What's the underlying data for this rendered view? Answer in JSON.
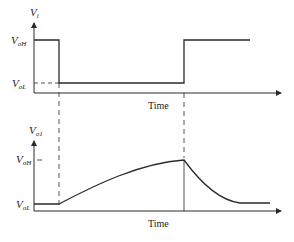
{
  "colors": {
    "line": "#2a2a2a",
    "background": "#ffffff"
  },
  "top_plot": {
    "y_label_main": "V",
    "y_label_sub": "i",
    "level_high_main": "V",
    "level_high_sub": "oH",
    "level_low_main": "V",
    "level_low_sub": "oL",
    "x_label": "Time"
  },
  "bottom_plot": {
    "y_label_main": "V",
    "y_label_sub": "o1",
    "level_high_main": "V",
    "level_high_sub": "oH",
    "level_low_main": "V",
    "level_low_sub": "oL",
    "x_label": "Time"
  }
}
